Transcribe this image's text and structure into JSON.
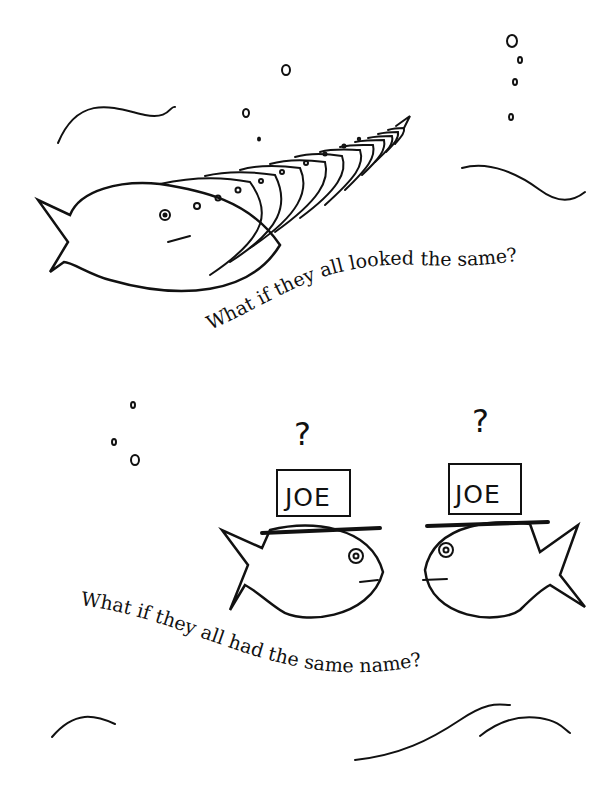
{
  "illustration": {
    "top_scene": {
      "caption": "What if they all looked the same?"
    },
    "bottom_scene": {
      "caption": "What if they all had the same name?",
      "fish_left": {
        "hat_label": "JOE",
        "thought": "?"
      },
      "fish_right": {
        "hat_label": "JOE",
        "thought": "?"
      }
    }
  },
  "colors": {
    "ink": "#111111",
    "background": "#ffffff"
  }
}
